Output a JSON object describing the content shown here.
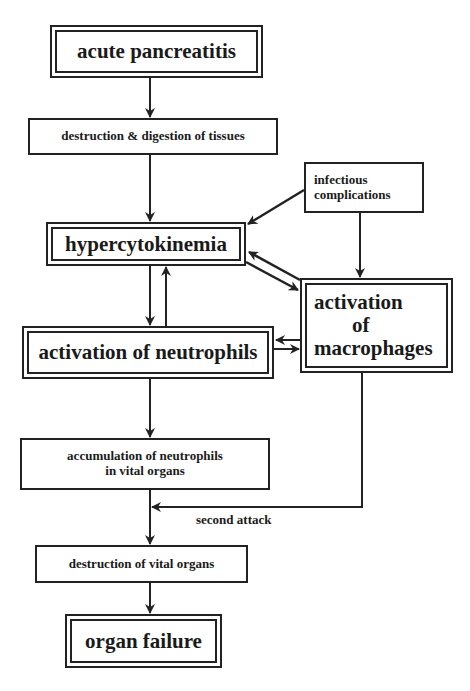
{
  "diagram": {
    "nodes": {
      "acute_pancreatitis": "acute pancreatitis",
      "destruction_digestion": "destruction & digestion of tissues",
      "infectious_complications_1": "infectious",
      "infectious_complications_2": "complications",
      "hypercytokinemia": "hypercytokinemia",
      "activation_macrophages_1": "activation",
      "activation_macrophages_2": "of",
      "activation_macrophages_3": "macrophages",
      "activation_neutrophils": "activation of neutrophils",
      "accumulation_1": "accumulation of neutrophils",
      "accumulation_2": "in vital organs",
      "destruction_vital_organs": "destruction of vital organs",
      "organ_failure": "organ failure"
    },
    "edge_labels": {
      "second_attack": "second attack"
    },
    "edges": [
      {
        "from": "acute pancreatitis",
        "to": "destruction & digestion of tissues"
      },
      {
        "from": "destruction & digestion of tissues",
        "to": "hypercytokinemia"
      },
      {
        "from": "infectious complications",
        "to": "hypercytokinemia"
      },
      {
        "from": "infectious complications",
        "to": "activation of macrophages"
      },
      {
        "from": "hypercytokinemia",
        "to": "activation of macrophages"
      },
      {
        "from": "activation of macrophages",
        "to": "hypercytokinemia"
      },
      {
        "from": "hypercytokinemia",
        "to": "activation of neutrophils"
      },
      {
        "from": "activation of neutrophils",
        "to": "hypercytokinemia"
      },
      {
        "from": "activation of macrophages",
        "to": "activation of neutrophils"
      },
      {
        "from": "activation of neutrophils",
        "to": "activation of macrophages"
      },
      {
        "from": "activation of neutrophils",
        "to": "accumulation of neutrophils in vital organs"
      },
      {
        "from": "accumulation of neutrophils in vital organs",
        "to": "destruction of vital organs"
      },
      {
        "from": "activation of macrophages",
        "to": "destruction of vital organs",
        "label": "second attack"
      },
      {
        "from": "destruction of vital organs",
        "to": "organ failure"
      }
    ]
  }
}
